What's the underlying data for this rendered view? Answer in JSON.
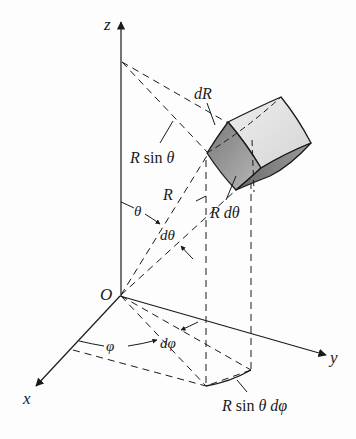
{
  "figure": {
    "axes": {
      "z": "z",
      "x": "x",
      "y": "y",
      "origin": "O"
    },
    "labels": {
      "dR": "dR",
      "R_sin_theta": "R sin θ",
      "R": "R",
      "theta": "θ",
      "d_theta": "dθ",
      "R_d_theta": "R dθ",
      "phi": "φ",
      "d_phi": "dφ",
      "R_sin_theta_d_phi": "R sin θ dφ"
    },
    "colors": {
      "line": "#1a1a1a",
      "face_dark": "#8a8a8a",
      "face_mid": "#b4b4b4",
      "face_light": "#dedede"
    }
  }
}
